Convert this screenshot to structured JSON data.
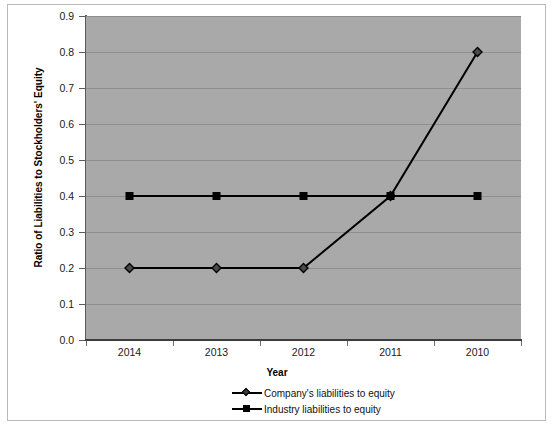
{
  "chart_data": {
    "type": "line",
    "title": "",
    "xlabel": "Year",
    "ylabel": "Ratio of Liabilities to Stockholders' Equity",
    "categories": [
      "2014",
      "2013",
      "2012",
      "2011",
      "2010"
    ],
    "series": [
      {
        "name": "Company's liabilities to equity",
        "marker": "diamond",
        "values": [
          0.2,
          0.2,
          0.2,
          0.4,
          0.8
        ]
      },
      {
        "name": "Industry liabilities to equity",
        "marker": "square",
        "values": [
          0.4,
          0.4,
          0.4,
          0.4,
          0.4
        ]
      }
    ],
    "ylim": [
      0.0,
      0.9
    ],
    "ytick_step": 0.1,
    "ytick_labels": [
      "0.0",
      "0.1",
      "0.2",
      "0.3",
      "0.4",
      "0.5",
      "0.6",
      "0.7",
      "0.8",
      "0.9"
    ],
    "grid": true,
    "grid_axis": "y",
    "legend_position": "bottom",
    "plot_background": "#a9a9a9",
    "gridline_color": "#8f8f8f",
    "series_color": "#000000",
    "figure_background": "#ffffff"
  },
  "axes": {
    "y_title": "Ratio of Liabilities to Stockholders' Equity",
    "x_title": "Year"
  },
  "legend": {
    "items": [
      {
        "label": "Company's liabilities to equity",
        "marker": "diamond-marker"
      },
      {
        "label": "Industry liabilities to equity",
        "marker": "square-marker"
      }
    ]
  }
}
